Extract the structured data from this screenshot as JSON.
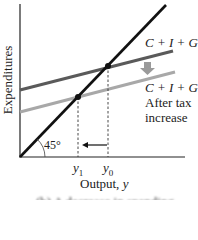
{
  "diagram": {
    "type": "keynesian-cross",
    "y_axis_label": "Expenditures",
    "x_axis_label_prefix": "Output, ",
    "x_axis_label_var": "y",
    "angle_label": "45°",
    "lines": {
      "original": {
        "label": "C + I + G",
        "color": "#5a5a5a"
      },
      "shifted": {
        "label": "C + I + G",
        "sublabel_1": "After tax",
        "sublabel_2": "increase",
        "color": "#a8a8a8"
      },
      "forty_five": {
        "color": "#111111"
      }
    },
    "ticks": {
      "y1": {
        "var": "y",
        "sub": "1"
      },
      "y0": {
        "var": "y",
        "sub": "0"
      }
    },
    "shift_arrow": {
      "direction": "down",
      "color": "#9a9a9a"
    },
    "output_arrow": {
      "direction": "left",
      "from": "y0",
      "to": "y1"
    },
    "caption": "(b) A decrease in spending"
  }
}
